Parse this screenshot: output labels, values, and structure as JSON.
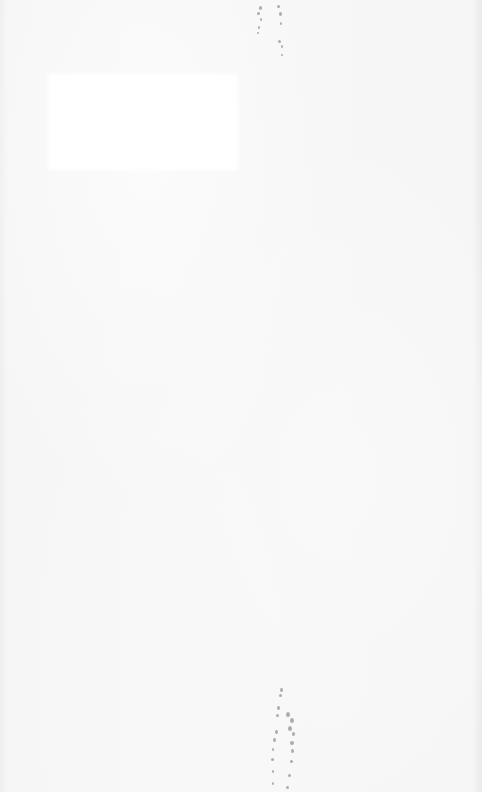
{
  "page": {
    "type": "scanned-blank-page",
    "background_color": "#f4f4f4",
    "patch_color": "#ffffff",
    "speckle_color": "#6e6e6e",
    "text_content": []
  }
}
